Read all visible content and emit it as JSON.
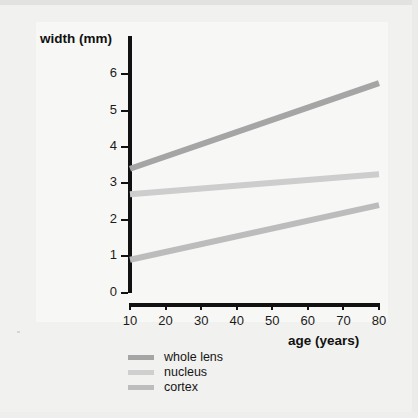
{
  "chart_data": {
    "type": "line",
    "title": "",
    "xlabel": "age (years)",
    "ylabel": "width (mm)",
    "xlim": [
      10,
      80
    ],
    "ylim": [
      0,
      6.3
    ],
    "grid": false,
    "legend_position": "bottom-left",
    "xticks": [
      10,
      20,
      30,
      40,
      50,
      60,
      70,
      80
    ],
    "xtick_labels": [
      "10",
      "20",
      "30",
      "40",
      "50",
      "60",
      "70",
      "80"
    ],
    "yticks": [
      0,
      1,
      2,
      3,
      4,
      5,
      6
    ],
    "ytick_labels": [
      "0",
      "1",
      "2",
      "3",
      "4",
      "5",
      "6"
    ],
    "x": [
      10,
      80
    ],
    "series": [
      {
        "name": "whole lens",
        "values": [
          3.4,
          5.75
        ],
        "color": "#a5a5a5"
      },
      {
        "name": "nucleus",
        "values": [
          2.7,
          3.25
        ],
        "color": "#cdcdcd"
      },
      {
        "name": "cortex",
        "values": [
          0.9,
          2.4
        ],
        "color": "#bcbcbc"
      }
    ]
  },
  "axes": {
    "y_title": "width (mm)",
    "x_title": "age (years)"
  },
  "legend": {
    "items": [
      {
        "label": "whole lens",
        "color": "#a5a5a5"
      },
      {
        "label": "nucleus",
        "color": "#cfcfcf"
      },
      {
        "label": "cortex",
        "color": "#bdbdbd"
      }
    ]
  },
  "colors": {
    "background": "#f1f1ef",
    "plot_background": "#f7f7f5",
    "axis": "#111111",
    "text": "#161616"
  }
}
